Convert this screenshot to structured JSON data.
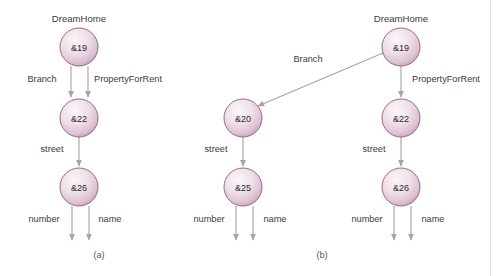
{
  "figure": {
    "background_color": "#ffffff",
    "node_border_color": "#8d5b78",
    "node_fill_light": "#f7eef3",
    "node_fill_dark": "#c49cb6",
    "edge_color": "#a6a6a6",
    "text_color": "#3b3b3b"
  },
  "panels": [
    {
      "id": "a",
      "caption": "(a)",
      "root_label": "DreamHome",
      "nodes": [
        {
          "id": "a-19",
          "label": "&19",
          "cx": 79,
          "cy": 47,
          "r": 19
        },
        {
          "id": "a-22",
          "label": "&22",
          "cx": 79,
          "cy": 118,
          "r": 19
        },
        {
          "id": "a-26",
          "label": "&26",
          "cx": 79,
          "cy": 187,
          "r": 19
        }
      ],
      "edges": [
        {
          "id": "a-branch",
          "label": "Branch",
          "label_x": 42,
          "label_y": 82
        },
        {
          "id": "a-propertyforrent",
          "label": "PropertyForRent",
          "label_x": 128,
          "label_y": 82
        },
        {
          "id": "a-street",
          "label": "street",
          "label_x": 52,
          "label_y": 152
        },
        {
          "id": "a-number",
          "label": "number",
          "label_x": 44,
          "label_y": 222
        },
        {
          "id": "a-name",
          "label": "name",
          "label_x": 110,
          "label_y": 222
        }
      ]
    },
    {
      "id": "b",
      "caption": "(b)",
      "root_label": "DreamHome",
      "nodes": [
        {
          "id": "b-19",
          "label": "&19",
          "cx": 401,
          "cy": 47,
          "r": 19
        },
        {
          "id": "b-20",
          "label": "&20",
          "cx": 243,
          "cy": 118,
          "r": 19
        },
        {
          "id": "b-25",
          "label": "&25",
          "cx": 243,
          "cy": 187,
          "r": 19
        },
        {
          "id": "b-22",
          "label": "&22",
          "cx": 401,
          "cy": 118,
          "r": 19
        },
        {
          "id": "b-26",
          "label": "&26",
          "cx": 401,
          "cy": 187,
          "r": 19
        }
      ],
      "edges": [
        {
          "id": "b-branch",
          "label": "Branch",
          "label_x": 308,
          "label_y": 62
        },
        {
          "id": "b-propertyforrent",
          "label": "PropertyForRent",
          "label_x": 412,
          "label_y": 82
        },
        {
          "id": "b-street-left",
          "label": "street",
          "label_x": 216,
          "label_y": 152
        },
        {
          "id": "b-street-right",
          "label": "street",
          "label_x": 374,
          "label_y": 152
        },
        {
          "id": "b-number-left",
          "label": "number",
          "label_x": 209,
          "label_y": 222
        },
        {
          "id": "b-name-left",
          "label": "name",
          "label_x": 275,
          "label_y": 222
        },
        {
          "id": "b-number-right",
          "label": "number",
          "label_x": 367,
          "label_y": 222
        },
        {
          "id": "b-name-right",
          "label": "name",
          "label_x": 433,
          "label_y": 222
        }
      ]
    }
  ]
}
